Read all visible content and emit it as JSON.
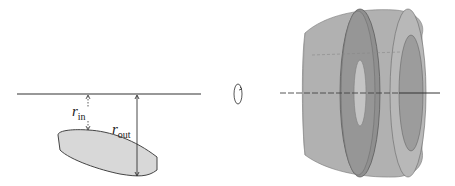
{
  "diagram": {
    "left_panel": {
      "labels": {
        "r_in": {
          "main": "r",
          "sub": "in"
        },
        "r_out": {
          "main": "r",
          "sub": "out"
        }
      },
      "region_fill": "#d8d8d8",
      "axis_color": "#333333"
    },
    "rotation_symbol": "rotation-arrow",
    "right_panel": {
      "solid_color": "#a9a9a9",
      "washer_color": "#8a8a8a",
      "hole_color": "#c8c8c8"
    }
  }
}
